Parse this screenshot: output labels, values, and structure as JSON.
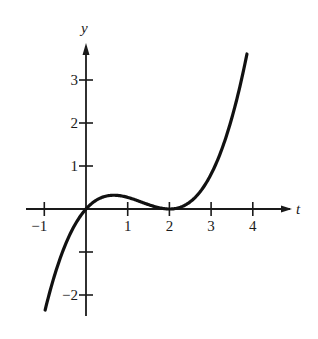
{
  "chart_data": {
    "type": "line",
    "title": "",
    "xlabel": "t",
    "ylabel": "y",
    "xlim": [
      -1.3,
      4.8
    ],
    "ylim": [
      -2.5,
      4.0
    ],
    "grid": false,
    "legend": null,
    "x_ticks": [
      -1,
      1,
      2,
      3,
      4
    ],
    "x_tick_labels": [
      "−1",
      "1",
      "2",
      "3",
      "4"
    ],
    "y_ticks": [
      3,
      2,
      1,
      -1,
      -2
    ],
    "y_tick_labels": [
      "3",
      "2",
      "1",
      "",
      "−2"
    ],
    "series": [
      {
        "name": "y = k t (t - 2)^2",
        "k": 0.27,
        "t_range": [
          -0.98,
          3.86
        ],
        "x": [
          -0.98,
          -0.75,
          -0.5,
          -0.25,
          0,
          0.25,
          0.5,
          0.67,
          0.75,
          1,
          1.25,
          1.5,
          1.75,
          2,
          2.25,
          2.5,
          2.75,
          3,
          3.25,
          3.5,
          3.75,
          3.86
        ],
        "values": [
          -2.35,
          -1.53,
          -0.84,
          -0.34,
          0,
          0.21,
          0.3,
          0.32,
          0.32,
          0.27,
          0.19,
          0.1,
          0.03,
          0,
          0.04,
          0.17,
          0.42,
          0.81,
          1.37,
          2.13,
          3.1,
          3.6
        ]
      }
    ]
  },
  "axes": {
    "x_label": "t",
    "y_label": "y"
  }
}
